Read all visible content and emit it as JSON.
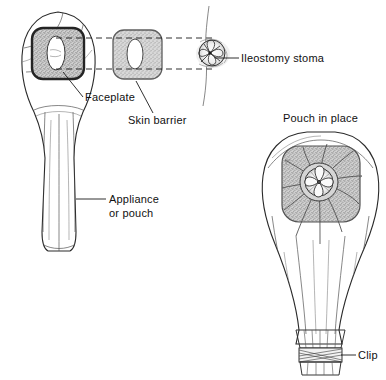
{
  "figure": {
    "title_visible": false,
    "background_color": "#ffffff",
    "ink_color": "#1a1a1a",
    "stipple_fill_color": "#b5b5b5",
    "pouch_fill_color": "#fbfbfb"
  },
  "labels": {
    "faceplate": "Faceplate",
    "skin_barrier": "Skin barrier",
    "ileostomy_stoma": "Ileostomy stoma",
    "appliance_line1": "Appliance",
    "appliance_line2": "or pouch",
    "pouch_in_place": "Pouch in place",
    "clip": "Clip"
  },
  "parts": [
    {
      "name": "appliance-pouch-front",
      "label": "Appliance or pouch",
      "description": "Tapered ostomy pouch shown front-on with faceplate attached at top"
    },
    {
      "name": "faceplate",
      "label": "Faceplate",
      "description": "Dark-bordered rounded square with stippled fill and central oval opening, mounted on pouch"
    },
    {
      "name": "skin-barrier",
      "label": "Skin barrier",
      "description": "Separate stippled rounded square wafer with central oval opening"
    },
    {
      "name": "ileostomy-stoma",
      "label": "Ileostomy stoma",
      "description": "Rosette-shaped protruding stoma on abdominal wall cross-section"
    },
    {
      "name": "pouch-in-place",
      "label": "Pouch in place",
      "description": "Assembled pouch worn over stoma, gathered and closed at the bottom"
    },
    {
      "name": "clip",
      "label": "Clip",
      "description": "Cross-hatched closure band gathering the bottom of the pouch"
    }
  ],
  "alignment_guides": {
    "count": 2,
    "style": "dashed",
    "description": "Two horizontal dashed lines aligning faceplate opening, skin barrier opening and stoma"
  }
}
